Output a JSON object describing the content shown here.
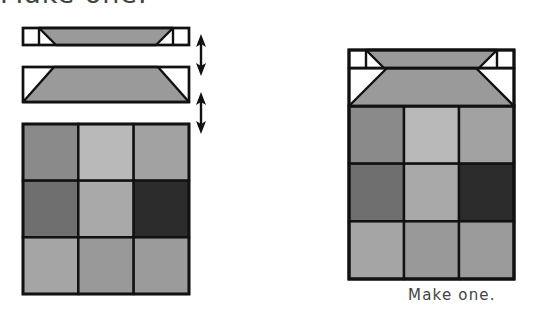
{
  "heading_clipped": "Make one.",
  "caption": "Make one.",
  "colors": {
    "outline": "#111111",
    "background_triangle": "#ffffff",
    "trapezoid_fill": "#9a9a9a"
  },
  "exploded_block": {
    "top_strip": {
      "x": 23,
      "y": 28,
      "w": 166,
      "h": 17,
      "corner_square": 16
    },
    "middle_strip": {
      "x": 23,
      "y": 67,
      "w": 166,
      "h": 35,
      "inset": 31
    },
    "grid": {
      "x": 23,
      "y": 124,
      "w": 166,
      "h": 170,
      "cells": [
        [
          "#8a8a8a",
          "#b9b9b9",
          "#a2a2a2"
        ],
        [
          "#6f6f6f",
          "#a9a9a9",
          "#2c2c2c"
        ],
        [
          "#a5a5a5",
          "#999999",
          "#9b9b9b"
        ]
      ]
    },
    "arrows": [
      {
        "name": "join-arrow-1",
        "x": 201,
        "y1": 34,
        "y2": 76
      },
      {
        "name": "join-arrow-2",
        "x": 201,
        "y1": 92,
        "y2": 134
      }
    ]
  },
  "finished_block": {
    "x": 349,
    "y": 50,
    "w": 165,
    "h": 229,
    "top_strip_h": 18,
    "middle_strip_h": 38,
    "grid_cells": [
      [
        "#8a8a8a",
        "#b9b9b9",
        "#a2a2a2"
      ],
      [
        "#6f6f6f",
        "#a9a9a9",
        "#2c2c2c"
      ],
      [
        "#a5a5a5",
        "#999999",
        "#9b9b9b"
      ]
    ]
  }
}
